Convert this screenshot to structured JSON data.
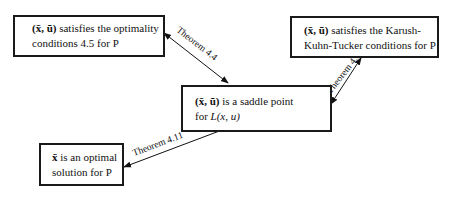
{
  "diagram": {
    "nodes": [
      {
        "id": "optimality",
        "symbol": "(x̄, ū)",
        "line1": "satisfies the optimality",
        "line2": "conditions 4.5 for P"
      },
      {
        "id": "kkt",
        "symbol": "(x̄, ū)",
        "line1": "satisfies the Karush-",
        "line2": "Kuhn-Tucker conditions for P"
      },
      {
        "id": "saddle",
        "symbol": "(x̄, ū)",
        "line1": "is a saddle point",
        "line2_prefix": "for ",
        "line2_math": "L(x, u)"
      },
      {
        "id": "optimal",
        "symbol": "x̄",
        "line1": "is an optimal",
        "line2": "solution for P"
      }
    ],
    "edges": [
      {
        "from": "optimality",
        "to": "saddle",
        "label": "Theorem 4.4",
        "direction": "both"
      },
      {
        "from": "saddle",
        "to": "kkt",
        "label": "Theorem 4.15",
        "direction": "both"
      },
      {
        "from": "optimal",
        "to": "saddle",
        "label": "Theorem 4.11",
        "direction": "both"
      }
    ]
  }
}
